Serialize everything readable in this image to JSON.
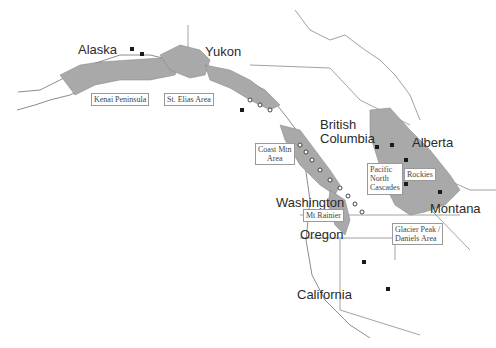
{
  "colors": {
    "land_fill": "#a9a9a9",
    "outline": "#6f6f6f",
    "border": "#8a8a8a",
    "site_square": "#1a1a1a",
    "site_circle_fill": "#ffffff",
    "site_circle_stroke": "#333333"
  },
  "map": {
    "regions": [
      {
        "id": "alaska",
        "label": "Alaska"
      },
      {
        "id": "yukon",
        "label": "Yukon"
      },
      {
        "id": "british_columbia",
        "label": "British Columbia",
        "line1": "British",
        "line2": "Columbia"
      },
      {
        "id": "alberta",
        "label": "Alberta"
      },
      {
        "id": "washington",
        "label": "Washington"
      },
      {
        "id": "oregon",
        "label": "Oregon"
      },
      {
        "id": "montana",
        "label": "Montana"
      },
      {
        "id": "california",
        "label": "California"
      }
    ],
    "callouts": [
      {
        "id": "kenai",
        "label": "Kenai Peninsula"
      },
      {
        "id": "st_elias",
        "label": "St. Elias Area"
      },
      {
        "id": "coast_mtn",
        "label": "Coast Mtn Area",
        "line1": "Coast Mtn",
        "line2": "Area"
      },
      {
        "id": "pacific_north_cascades",
        "label": "Pacific North Cascades",
        "line1": "Pacific",
        "line2": "North",
        "line3": "Cascades"
      },
      {
        "id": "rockies",
        "label": "Rockies"
      },
      {
        "id": "mt_rainier",
        "label": "Mt Rainier"
      },
      {
        "id": "glacier_peak",
        "label": "Glacier Peak / Daniels Area",
        "line1": "Glacier Peak /",
        "line2": "Daniels Area"
      }
    ],
    "legend_markers": {
      "square": "site-square-marker",
      "circle": "site-circle-marker"
    }
  }
}
